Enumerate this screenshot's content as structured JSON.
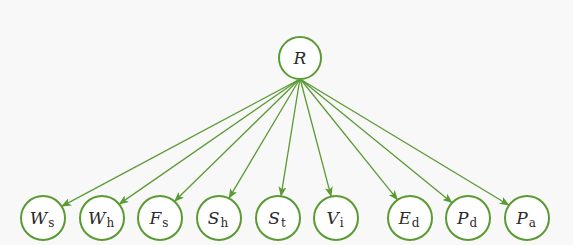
{
  "diagram": {
    "type": "tree",
    "colors": {
      "edge": "#5a9a32",
      "node_stroke": "#5a9a32",
      "node_fill": "#ffffff",
      "background": "#f8f8f8",
      "text": "#2a2a2a"
    },
    "root": {
      "id": "R",
      "symbol": "R",
      "subscript": "",
      "cx": 300,
      "cy": 58,
      "r": 21
    },
    "children": [
      {
        "id": "Ws",
        "symbol": "W",
        "subscript": "s",
        "cx": 43,
        "cy": 218,
        "r": 22
      },
      {
        "id": "Wh",
        "symbol": "W",
        "subscript": "h",
        "cx": 102,
        "cy": 218,
        "r": 22
      },
      {
        "id": "Fs",
        "symbol": "F",
        "subscript": "s",
        "cx": 160,
        "cy": 218,
        "r": 22
      },
      {
        "id": "Sh",
        "symbol": "S",
        "subscript": "h",
        "cx": 219,
        "cy": 218,
        "r": 22
      },
      {
        "id": "St",
        "symbol": "S",
        "subscript": "t",
        "cx": 278,
        "cy": 218,
        "r": 22
      },
      {
        "id": "Vi",
        "symbol": "V",
        "subscript": "i",
        "cx": 336,
        "cy": 218,
        "r": 22
      },
      {
        "id": "Ed",
        "symbol": "E",
        "subscript": "d",
        "cx": 410,
        "cy": 218,
        "r": 22
      },
      {
        "id": "Pd",
        "symbol": "P",
        "subscript": "d",
        "cx": 468,
        "cy": 218,
        "r": 22
      },
      {
        "id": "Pa",
        "symbol": "P",
        "subscript": "a",
        "cx": 527,
        "cy": 218,
        "r": 22
      }
    ],
    "edges": [
      {
        "from": "R",
        "to": "Ws"
      },
      {
        "from": "R",
        "to": "Wh"
      },
      {
        "from": "R",
        "to": "Fs"
      },
      {
        "from": "R",
        "to": "Sh"
      },
      {
        "from": "R",
        "to": "St"
      },
      {
        "from": "R",
        "to": "Vi"
      },
      {
        "from": "R",
        "to": "Ed"
      },
      {
        "from": "R",
        "to": "Pd"
      },
      {
        "from": "R",
        "to": "Pa"
      }
    ]
  }
}
